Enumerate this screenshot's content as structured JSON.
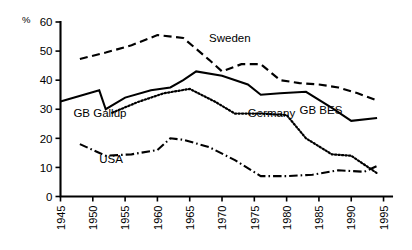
{
  "chart_data": {
    "type": "line",
    "title": "",
    "subtitle": "",
    "xlabel": "",
    "ylabel": "%",
    "unit_label": "%",
    "xlim": [
      1945,
      1996
    ],
    "ylim": [
      0,
      60
    ],
    "yticks": [
      0,
      10,
      20,
      30,
      40,
      50,
      60
    ],
    "xticks": [
      1945,
      1950,
      1955,
      1960,
      1965,
      1970,
      1975,
      1980,
      1985,
      1990,
      1995
    ],
    "grid": false,
    "legend_position": "inline-annotations",
    "series": [
      {
        "name": "Sweden",
        "style": "dashed",
        "label_x": 1968,
        "label_y": 53,
        "x": [
          1948,
          1952,
          1956,
          1960,
          1964,
          1968,
          1970,
          1973,
          1976,
          1979,
          1982,
          1985,
          1988,
          1991,
          1994
        ],
        "values": [
          47.3,
          49.5,
          52.0,
          55.5,
          54.5,
          47.0,
          43.0,
          45.5,
          45.5,
          40.0,
          39.0,
          38.5,
          37.5,
          35.5,
          33.0
        ]
      },
      {
        "name": "GB Gallup",
        "style": "solid",
        "label_x": 1947,
        "label_y": 27.5,
        "x": [
          1945,
          1951,
          1952,
          1955,
          1959,
          1962,
          1964,
          1966,
          1970,
          1974,
          1976,
          1979,
          1983,
          1987,
          1990,
          1994
        ],
        "values": [
          32.7,
          36.5,
          30.0,
          34.0,
          36.5,
          37.5,
          40.0,
          43.0,
          41.5,
          38.5,
          35.0,
          35.5,
          36.0,
          30.5,
          26.0,
          27.0
        ]
      },
      {
        "name": "GB BES",
        "style": "solid",
        "label_x": 1982,
        "label_y": 28.5,
        "x": [],
        "values": []
      },
      {
        "name": "Germany",
        "style": "dotted",
        "label_x": 1974,
        "label_y": 27.5,
        "x": [
          1953,
          1957,
          1961,
          1965,
          1969,
          1972,
          1976,
          1980,
          1983,
          1987,
          1990,
          1994
        ],
        "values": [
          28.8,
          32.5,
          35.5,
          37.0,
          32.5,
          28.5,
          28.5,
          28.0,
          20.0,
          14.5,
          14.0,
          8.0
        ]
      },
      {
        "name": "USA",
        "style": "dash-dot",
        "label_x": 1951,
        "label_y": 11.5,
        "x": [
          1948,
          1952,
          1956,
          1960,
          1962,
          1964,
          1968,
          1972,
          1976,
          1980,
          1984,
          1988,
          1992,
          1994
        ],
        "values": [
          18.0,
          14.0,
          14.5,
          16.0,
          20.0,
          19.5,
          17.0,
          12.5,
          7.0,
          7.0,
          7.5,
          9.0,
          8.5,
          10.5
        ]
      }
    ]
  }
}
